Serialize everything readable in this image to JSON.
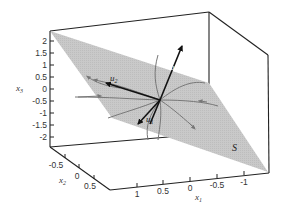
{
  "figure": {
    "type": "3d-plot",
    "axes": {
      "x1": {
        "label": "x",
        "subscript": "1",
        "ticks": [
          "1",
          "0.5",
          "0",
          "-0.5",
          "-1"
        ]
      },
      "x2": {
        "label": "x",
        "subscript": "2",
        "ticks": [
          "-0.5",
          "0",
          "0.5"
        ]
      },
      "x3": {
        "label": "x",
        "subscript": "3",
        "ticks": [
          "2",
          "1.5",
          "1",
          "0.5",
          "0",
          "-0.5",
          "-1",
          "-1.5",
          "-2"
        ]
      }
    },
    "plane": {
      "label": "S",
      "color": "#c8c8c8"
    },
    "vectors": [
      {
        "name": "u1",
        "label": "u",
        "subscript": "1"
      },
      {
        "name": "u2",
        "label": "u",
        "subscript": "2"
      },
      {
        "name": "u3",
        "label": "u",
        "subscript": "3"
      }
    ],
    "colors": {
      "box": "#222222",
      "plane": "#c6c6c6",
      "trajectories": "#7a7a7a",
      "vectors": "#111111"
    }
  }
}
